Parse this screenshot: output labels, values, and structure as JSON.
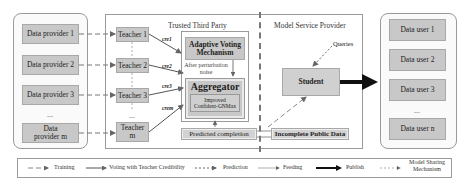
{
  "providers": {
    "items": [
      "Data provider 1",
      "Data provider 2",
      "Data provider 3",
      "Data provider m"
    ],
    "ellipsis": "..."
  },
  "trusted_third_party": {
    "title": "Trusted Third Party",
    "teachers": [
      "Teacher 1",
      "Teacher 2",
      "Teacher 3",
      "Teacher m"
    ],
    "ellipsis": "...",
    "credibility_labels": [
      "cre1",
      "cre2",
      "cre3",
      "crem"
    ],
    "voting": "Adaptive Voting Mechanism",
    "noise_note": "After perturbation noise",
    "aggregator": "Aggregator",
    "aggregator_inner": "Improved Confident-GNMax",
    "predicted": "Predicted completion"
  },
  "model_service_provider": {
    "title": "Model Service Provider",
    "queries": "Queries",
    "student": "Student",
    "public_data": "Incomplete Public Data"
  },
  "users": {
    "items": [
      "Data user 1",
      "Data user 2",
      "Data user 3",
      "Data user n"
    ],
    "ellipsis": "..."
  },
  "legend": {
    "training": "Training",
    "voting": "Voting with Teacher Credibility",
    "prediction": "Prediction",
    "feeding": "Feeding",
    "publish": "Publish",
    "model_sharing": "Model Sharing Mechanism"
  },
  "colors": {
    "box_fill": "#c8c8c8",
    "border": "#9a9a9a",
    "arrow": "#555555",
    "publish_arrow": "#111111"
  }
}
